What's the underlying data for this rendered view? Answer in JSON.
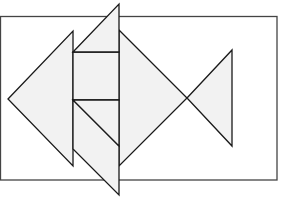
{
  "diagram": {
    "colors": {
      "background": "#ffffff",
      "piece_fill": "#f2f2f2",
      "stroke": "#1a1a1a",
      "frame_stroke": "#444444"
    },
    "frame": {
      "x": 0,
      "y": 16,
      "width": 277,
      "height": 164
    },
    "pieces": [
      {
        "name": "left-large-triangle",
        "points": "8,99 73,31 73,166"
      },
      {
        "name": "top-triangle",
        "points": "73,52 119,4 119,52"
      },
      {
        "name": "upper-square",
        "points": "73,52 119,52 119,100 73,100"
      },
      {
        "name": "lower-triangle-a",
        "points": "73,100 119,100 119,146"
      },
      {
        "name": "lower-parallelogram",
        "points": "73,100 119,146 119,195 73,149"
      },
      {
        "name": "body-right-triangle",
        "points": "119,30 187,98 119,166"
      },
      {
        "name": "tail-triangle",
        "points": "187,98 232,50 232,146"
      }
    ]
  }
}
